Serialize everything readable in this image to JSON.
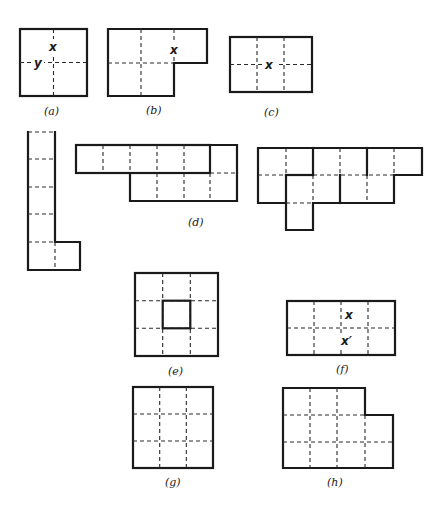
{
  "figure": {
    "panels": [
      {
        "id": "a",
        "label": "(a)",
        "marks": [
          "x",
          "y"
        ]
      },
      {
        "id": "b",
        "label": "(b)",
        "marks": [
          "x"
        ]
      },
      {
        "id": "c",
        "label": "(c)",
        "marks": [
          "x"
        ]
      },
      {
        "id": "d",
        "label": "(d)",
        "marks": []
      },
      {
        "id": "e",
        "label": "(e)",
        "marks": []
      },
      {
        "id": "f",
        "label": "(f)",
        "marks": [
          "x",
          "x′"
        ]
      },
      {
        "id": "g",
        "label": "(g)",
        "marks": []
      },
      {
        "id": "h",
        "label": "(h)",
        "marks": []
      }
    ],
    "colors": {
      "ink": "#1a1a1a",
      "background": "#ffffff"
    }
  }
}
